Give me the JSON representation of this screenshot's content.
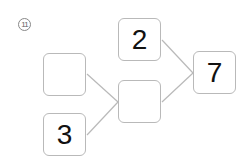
{
  "problem": {
    "number_label": "11"
  },
  "boxes": {
    "top_left": "",
    "bottom_left": "3",
    "middle": "",
    "top": "2",
    "result": "7"
  }
}
